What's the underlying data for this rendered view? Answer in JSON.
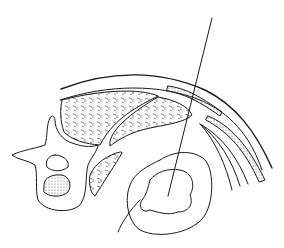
{
  "figure": {
    "type": "anatomical cross-section line drawing",
    "colors": {
      "line": "#1a1a1a",
      "background": "#ffffff"
    },
    "parts": [
      {
        "id": "needle",
        "label": ""
      },
      {
        "id": "vertebra",
        "label": ""
      },
      {
        "id": "muscles",
        "label": ""
      },
      {
        "id": "abdominal-wall",
        "label": ""
      },
      {
        "id": "kidney",
        "label": ""
      }
    ]
  }
}
